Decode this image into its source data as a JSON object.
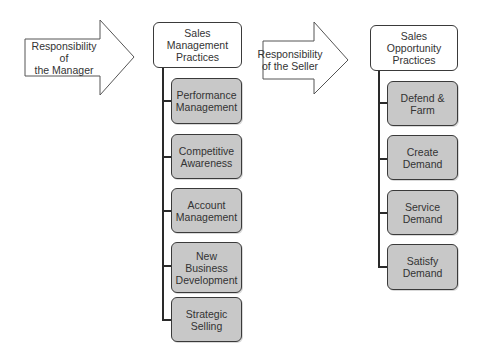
{
  "arrows": [
    {
      "label": "Responsibility of\nthe Manager"
    },
    {
      "label": "Responsibility\nof the Seller"
    }
  ],
  "columns": [
    {
      "header": "Sales\nManagement\nPractices",
      "items": [
        "Performance\nManagement",
        "Competitive\nAwareness",
        "Account\nManagement",
        "New\nBusiness\nDevelopment",
        "Strategic\nSelling"
      ]
    },
    {
      "header": "Sales\nOpportunity\nPractices",
      "items": [
        "Defend &\nFarm",
        "Create\nDemand",
        "Service\nDemand",
        "Satisfy\nDemand"
      ]
    }
  ],
  "colors": {
    "box_fill": "#c8c8c8",
    "header_fill": "#ffffff",
    "line": "#2a2a2a"
  }
}
